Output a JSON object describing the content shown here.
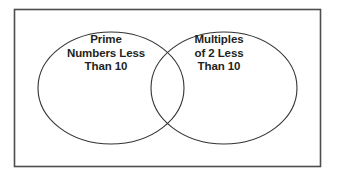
{
  "diagram": {
    "type": "venn-diagram",
    "title": "",
    "border_color": "#4d4d4d",
    "outline_color": "#333333",
    "background_color": "#ffffff",
    "text_color": "#231f20",
    "sets": [
      {
        "id": "left",
        "name": "prime-numbers-less-than-10",
        "label_lines": [
          "Prime",
          "Numbers Less",
          "Than 10"
        ]
      },
      {
        "id": "right",
        "name": "multiples-of-2-less-than-10",
        "label_lines": [
          "Multiples",
          "of 2 Less",
          "Than 10"
        ]
      }
    ],
    "intersection": {
      "name": "overlap-region",
      "label": ""
    }
  }
}
